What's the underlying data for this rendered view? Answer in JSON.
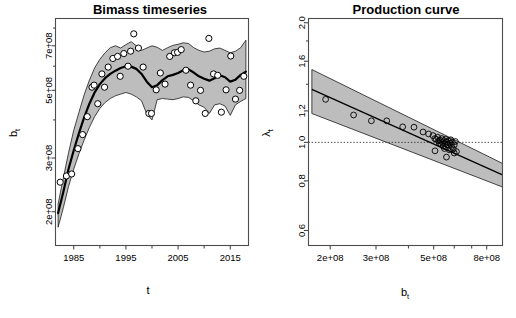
{
  "figure": {
    "width": 516,
    "height": 318,
    "background": "#ffffff",
    "band_color": "#bdbdbd",
    "line_color": "#000000",
    "frame_color": "#4d4d4d"
  },
  "chart_data": [
    {
      "type": "line",
      "panel": "left",
      "title": "Bimass timeseries",
      "xlabel": "t",
      "ylabel": "b_t",
      "ylabel_display": "b",
      "ylabel_sub": "t",
      "xscale": "linear",
      "yscale": "log",
      "xlim": [
        1981.5,
        2018.5
      ],
      "ylim": [
        155000000,
        860000000
      ],
      "grid": false,
      "legend": "none",
      "xticks": [
        1985,
        1995,
        2005,
        2015
      ],
      "xtick_labels": [
        "1985",
        "1995",
        "2005",
        "2015"
      ],
      "xminor_ticks": [
        1990,
        2000,
        2010
      ],
      "yticks": [
        200000000,
        300000000,
        500000000,
        700000000
      ],
      "ytick_labels": [
        "2e+08",
        "3e+08",
        "5e+08",
        "7e+08"
      ],
      "series": [
        {
          "name": "median biomass",
          "style": "thick black line",
          "x": [
            1982,
            1983,
            1984,
            1985,
            1986,
            1987,
            1988,
            1989,
            1990,
            1991,
            1992,
            1993,
            1994,
            1995,
            1996,
            1997,
            1998,
            1999,
            2000,
            2001,
            2002,
            2003,
            2004,
            2005,
            2006,
            2007,
            2008,
            2009,
            2010,
            2011,
            2012,
            2013,
            2014,
            2015,
            2016,
            2017,
            2018
          ],
          "values": [
            198000000,
            232000000,
            276000000,
            318000000,
            362000000,
            408000000,
            452000000,
            492000000,
            524000000,
            548000000,
            566000000,
            580000000,
            592000000,
            600000000,
            598000000,
            588000000,
            566000000,
            534000000,
            512000000,
            520000000,
            540000000,
            556000000,
            562000000,
            570000000,
            582000000,
            586000000,
            572000000,
            556000000,
            546000000,
            538000000,
            548000000,
            560000000,
            552000000,
            534000000,
            542000000,
            562000000,
            576000000
          ]
        },
        {
          "name": "upper 95% bound",
          "style": "gray ribbon edge",
          "x": [
            1982,
            1983,
            1984,
            1985,
            1986,
            1987,
            1988,
            1989,
            1990,
            1991,
            1992,
            1993,
            1994,
            1995,
            1996,
            1997,
            1998,
            1999,
            2000,
            2001,
            2002,
            2003,
            2004,
            2005,
            2006,
            2007,
            2008,
            2009,
            2010,
            2011,
            2012,
            2013,
            2014,
            2015,
            2016,
            2017,
            2018
          ],
          "values": [
            212000000,
            258000000,
            312000000,
            370000000,
            424000000,
            484000000,
            540000000,
            592000000,
            632000000,
            664000000,
            690000000,
            700000000,
            688000000,
            706000000,
            722000000,
            700000000,
            676000000,
            688000000,
            700000000,
            692000000,
            676000000,
            690000000,
            702000000,
            708000000,
            716000000,
            712000000,
            690000000,
            676000000,
            668000000,
            672000000,
            684000000,
            688000000,
            676000000,
            664000000,
            672000000,
            690000000,
            730000000
          ]
        },
        {
          "name": "lower 95% bound",
          "style": "gray ribbon edge",
          "x": [
            1982,
            1983,
            1984,
            1985,
            1986,
            1987,
            1988,
            1989,
            1990,
            1991,
            1992,
            1993,
            1994,
            1995,
            1996,
            1997,
            1998,
            1999,
            2000,
            2001,
            2002,
            2003,
            2004,
            2005,
            2006,
            2007,
            2008,
            2009,
            2010,
            2011,
            2012,
            2013,
            2014,
            2015,
            2016,
            2017,
            2018
          ],
          "values": [
            178000000,
            206000000,
            242000000,
            276000000,
            310000000,
            344000000,
            378000000,
            410000000,
            436000000,
            456000000,
            470000000,
            480000000,
            486000000,
            492000000,
            486000000,
            476000000,
            462000000,
            418000000,
            400000000,
            466000000,
            470000000,
            468000000,
            466000000,
            470000000,
            476000000,
            474000000,
            462000000,
            448000000,
            440000000,
            420000000,
            448000000,
            452000000,
            444000000,
            414000000,
            448000000,
            460000000,
            470000000
          ]
        },
        {
          "name": "observations",
          "style": "open circles",
          "points": [
            [
              1982.4,
              250000000
            ],
            [
              1983.6,
              262000000
            ],
            [
              1984.6,
              266000000
            ],
            [
              1985.8,
              322000000
            ],
            [
              1986.7,
              358000000
            ],
            [
              1987.6,
              410000000
            ],
            [
              1988.5,
              512000000
            ],
            [
              1988.9,
              520000000
            ],
            [
              1989.6,
              452000000
            ],
            [
              1990.4,
              566000000
            ],
            [
              1990.9,
              512000000
            ],
            [
              1991.6,
              596000000
            ],
            [
              1992.5,
              636000000
            ],
            [
              1993.4,
              646000000
            ],
            [
              1993.9,
              556000000
            ],
            [
              1994.6,
              660000000
            ],
            [
              1995.4,
              600000000
            ],
            [
              1995.9,
              672000000
            ],
            [
              1996.5,
              766000000
            ],
            [
              1997.4,
              688000000
            ],
            [
              1998.3,
              596000000
            ],
            [
              1999.4,
              420000000
            ],
            [
              1999.9,
              420000000
            ],
            [
              2000.8,
              502000000
            ],
            [
              2001.6,
              570000000
            ],
            [
              2002.5,
              524000000
            ],
            [
              2003.4,
              646000000
            ],
            [
              2004.3,
              664000000
            ],
            [
              2004.9,
              666000000
            ],
            [
              2005.6,
              680000000
            ],
            [
              2006.5,
              582000000
            ],
            [
              2007.4,
              520000000
            ],
            [
              2008.4,
              462000000
            ],
            [
              2009.3,
              500000000
            ],
            [
              2010.2,
              420000000
            ],
            [
              2010.9,
              740000000
            ],
            [
              2011.8,
              566000000
            ],
            [
              2012.6,
              560000000
            ],
            [
              2013.3,
              424000000
            ],
            [
              2014.2,
              502000000
            ],
            [
              2015.1,
              648000000
            ],
            [
              2016.0,
              468000000
            ],
            [
              2016.8,
              500000000
            ],
            [
              2017.6,
              556000000
            ]
          ]
        }
      ]
    },
    {
      "type": "scatter",
      "panel": "right",
      "title": "Production curve",
      "xlabel": "b_t",
      "xlabel_display": "b",
      "xlabel_sub": "t",
      "ylabel": "lambda_t",
      "ylabel_display": "λ",
      "ylabel_sub": "t",
      "xscale": "log",
      "yscale": "log",
      "xlim": [
        165000000,
        920000000
      ],
      "ylim": [
        0.55,
        2.05
      ],
      "grid": false,
      "legend": "none",
      "xticks": [
        200000000,
        300000000,
        500000000,
        800000000
      ],
      "xtick_labels": [
        "2e+08",
        "3e+08",
        "5e+08",
        "8e+08"
      ],
      "xminor_ticks": [
        400000000,
        600000000,
        700000000
      ],
      "yticks": [
        0.6,
        0.8,
        1.0,
        1.2,
        1.6,
        2.0
      ],
      "ytick_labels": [
        "0.6",
        "0.8",
        "1.0",
        "1.2",
        "1.6",
        "2.0"
      ],
      "reference_line": {
        "type": "horizontal",
        "y": 1.0,
        "style": "dotted"
      },
      "series": [
        {
          "name": "fitted production curve",
          "style": "solid line",
          "x": [
            170000000,
            920000000
          ],
          "values": [
            1.36,
            0.828
          ]
        },
        {
          "name": "upper confidence bound",
          "style": "gray wedge edge",
          "x": [
            170000000,
            920000000
          ],
          "values": [
            1.525,
            0.885
          ]
        },
        {
          "name": "lower confidence bound",
          "style": "gray wedge edge",
          "x": [
            170000000,
            920000000
          ],
          "values": [
            1.182,
            0.772
          ]
        },
        {
          "name": "observations",
          "style": "open circles",
          "points": [
            [
              192000000,
              1.283
            ],
            [
              246000000,
              1.172
            ],
            [
              288000000,
              1.133
            ],
            [
              330000000,
              1.133
            ],
            [
              380000000,
              1.094
            ],
            [
              420000000,
              1.092
            ],
            [
              455000000,
              1.062
            ],
            [
              478000000,
              1.05
            ],
            [
              497000000,
              1.04
            ],
            [
              505000000,
              1.022
            ],
            [
              512000000,
              1.018
            ],
            [
              518000000,
              1.03
            ],
            [
              522000000,
              1.008
            ],
            [
              526000000,
              0.995
            ],
            [
              530000000,
              1.012
            ],
            [
              534000000,
              0.988
            ],
            [
              538000000,
              1.022
            ],
            [
              540000000,
              1.0
            ],
            [
              544000000,
              0.978
            ],
            [
              548000000,
              1.01
            ],
            [
              550000000,
              0.965
            ],
            [
              554000000,
              0.992
            ],
            [
              556000000,
              1.018
            ],
            [
              560000000,
              0.972
            ],
            [
              562000000,
              1.002
            ],
            [
              566000000,
              0.985
            ],
            [
              570000000,
              1.008
            ],
            [
              574000000,
              0.958
            ],
            [
              578000000,
              0.995
            ],
            [
              582000000,
              1.015
            ],
            [
              586000000,
              0.975
            ],
            [
              590000000,
              1.0
            ],
            [
              595000000,
              0.962
            ],
            [
              600000000,
              0.985
            ],
            [
              606000000,
              1.005
            ],
            [
              612000000,
              0.948
            ],
            [
              560000000,
              0.918
            ],
            [
              506000000,
              0.952
            ],
            [
              600000000,
              0.94
            ]
          ]
        }
      ]
    }
  ]
}
